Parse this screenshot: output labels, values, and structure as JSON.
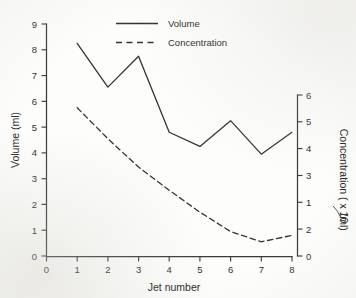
{
  "chart_data": {
    "type": "line",
    "title": "",
    "xlabel": "Jet number",
    "ylabel": "Volume (ml)",
    "y2label": "Concentration ( x 10",
    "y2label_tail": "/ml)",
    "y2label_sup": "⁀",
    "x": [
      1,
      2,
      3,
      4,
      5,
      6,
      7,
      8
    ],
    "xlim": [
      0,
      8
    ],
    "ylim": [
      0,
      9
    ],
    "y2lim": [
      0,
      6
    ],
    "grid": false,
    "legend_position": "top-center",
    "xticks": [
      "0",
      "1",
      "2",
      "3",
      "4",
      "5",
      "6",
      "7",
      "8"
    ],
    "yticks": [
      "0",
      "1",
      "2",
      "3",
      "4",
      "5",
      "6",
      "7",
      "8",
      "9"
    ],
    "y2ticks": [
      "0",
      "2",
      "1",
      "3",
      "4",
      "5",
      "6"
    ],
    "series": [
      {
        "name": "Volume",
        "style": "solid",
        "axis": "left",
        "values": [
          8.25,
          6.55,
          7.75,
          4.8,
          4.25,
          5.25,
          3.95,
          4.8
        ]
      },
      {
        "name": "Concentration",
        "style": "dashed",
        "axis": "right",
        "values_left_scale": [
          5.75,
          4.55,
          3.45,
          2.55,
          1.7,
          0.95,
          0.55,
          0.8
        ],
        "values": [
          3.83,
          3.03,
          2.3,
          1.7,
          1.13,
          0.63,
          0.37,
          0.53
        ]
      }
    ]
  },
  "legend": {
    "items": [
      {
        "label": "Volume",
        "style": "solid"
      },
      {
        "label": "Concentration",
        "style": "dashed"
      }
    ]
  }
}
